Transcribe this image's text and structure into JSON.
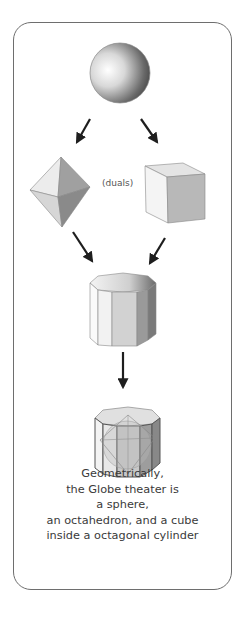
{
  "figure": {
    "nodes": [
      {
        "id": "sphere",
        "label": "sphere"
      },
      {
        "id": "octahedron",
        "label": "octahedron"
      },
      {
        "id": "cube",
        "label": "cube"
      },
      {
        "id": "octagonal-cylinder",
        "label": "octagonal cylinder"
      },
      {
        "id": "combined",
        "label": "combined solids inside octagonal cylinder"
      }
    ],
    "edges": [
      {
        "from": "sphere",
        "to": "octahedron"
      },
      {
        "from": "sphere",
        "to": "cube"
      },
      {
        "from": "octahedron",
        "to": "octagonal-cylinder"
      },
      {
        "from": "cube",
        "to": "octagonal-cylinder"
      },
      {
        "from": "octagonal-cylinder",
        "to": "combined"
      }
    ],
    "duals_label": "(duals)"
  },
  "caption": {
    "lines": [
      "Geometrically,",
      "the Globe theater is",
      "a sphere,",
      "an octahedron, and a cube",
      "inside a octagonal cylinder"
    ]
  },
  "colors": {
    "frame": "#6e6e6e",
    "arrow": "#1e1e1e",
    "text": "#3a3a3a"
  }
}
